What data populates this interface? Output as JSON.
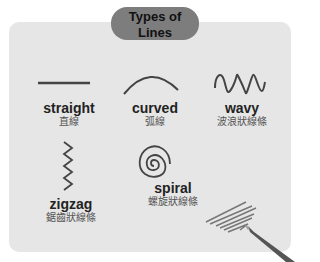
{
  "title": {
    "en": "Types of Lines",
    "zh": "線條的種類"
  },
  "items": [
    {
      "en": "straight",
      "zh": "直線",
      "icon": "straight-line-icon"
    },
    {
      "en": "curved",
      "zh": "弧線",
      "icon": "curved-line-icon"
    },
    {
      "en": "wavy",
      "zh": "波浪狀線條",
      "icon": "wavy-line-icon"
    },
    {
      "en": "zigzag",
      "zh": "鋸齒狀線條",
      "icon": "zigzag-line-icon"
    },
    {
      "en": "spiral",
      "zh": "螺旋狀線條",
      "icon": "spiral-line-icon"
    }
  ],
  "colors": {
    "card": "#e6e6e6",
    "pill": "#7d7d7d",
    "line": "#444444"
  }
}
